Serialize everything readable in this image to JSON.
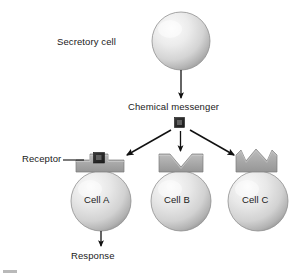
{
  "figure": {
    "type": "biology-diagram"
  },
  "labels": {
    "secretory_cell": "Secretory cell",
    "chemical_messenger": "Chemical messenger",
    "receptor": "Receptor",
    "cell_a": "Cell A",
    "cell_b": "Cell B",
    "cell_c": "Cell C",
    "response": "Response"
  },
  "colors": {
    "cell_fill_light": "#f2f2f2",
    "cell_fill_mid": "#d0d0d0",
    "cell_fill_dark": "#9f9f9f",
    "cell_outline": "#8a8a8a",
    "receptor_fill": "#a8a8a8",
    "receptor_outline": "#7d7d7d",
    "messenger_fill": "#2b2b2b",
    "messenger_highlight": "#6e6e6e",
    "arrow": "#111111",
    "text": "#1a1a1a",
    "background": "#ffffff"
  },
  "elements": {
    "secretory_cell": {
      "shape": "sphere",
      "cx": 181,
      "cy": 41,
      "r": 29
    },
    "chemical_messenger": {
      "shape": "square",
      "x": 174,
      "y": 117,
      "size": 10
    },
    "target_cells": [
      {
        "name": "Cell A",
        "cx": 101,
        "cy": 200,
        "r": 31,
        "receptor": "square-notch-slab",
        "bound": true,
        "responds": true
      },
      {
        "name": "Cell B",
        "cx": 181,
        "cy": 200,
        "r": 31,
        "receptor": "v-notch-slab",
        "bound": false,
        "responds": false
      },
      {
        "name": "Cell C",
        "cx": 258,
        "cy": 200,
        "r": 31,
        "receptor": "crown-three-peaks",
        "bound": false,
        "responds": false
      }
    ],
    "arrows": [
      {
        "name": "secretion-arrow",
        "from": [
          181,
          70
        ],
        "to": [
          181,
          99
        ],
        "kind": "straight-down"
      },
      {
        "name": "messenger-to-cell-a-arrow",
        "from": [
          171,
          130
        ],
        "to": [
          126,
          155
        ],
        "kind": "diagonal-left"
      },
      {
        "name": "messenger-to-cell-b-arrow",
        "from": [
          181,
          131
        ],
        "to": [
          181,
          152
        ],
        "kind": "straight-down"
      },
      {
        "name": "messenger-to-cell-c-arrow",
        "from": [
          191,
          130
        ],
        "to": [
          236,
          155
        ],
        "kind": "diagonal-right"
      },
      {
        "name": "response-arrow",
        "from": [
          101,
          231
        ],
        "to": [
          101,
          247
        ],
        "kind": "straight-down"
      }
    ],
    "leader_lines": [
      {
        "name": "receptor-leader-line",
        "from": [
          62,
          160
        ],
        "to": [
          84,
          160
        ]
      }
    ]
  }
}
